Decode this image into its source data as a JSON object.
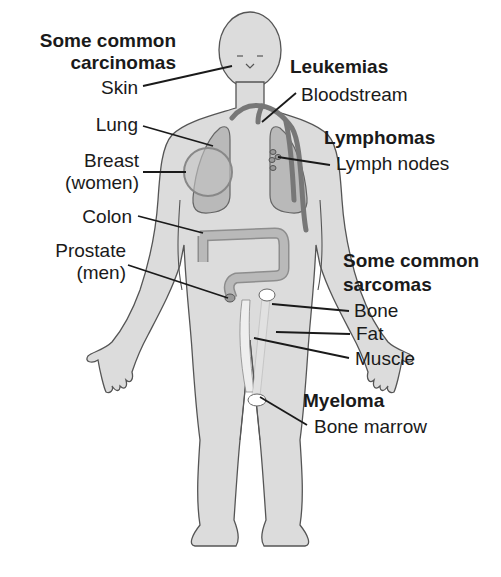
{
  "diagram": {
    "type": "anatomical-illustration",
    "colors": {
      "body_fill": "#dcdcdc",
      "body_outline": "#555555",
      "organ_fill": "#b9b9b9",
      "vessel": "#777777",
      "leader_line": "#1a1a1a",
      "bone": "#ffffff"
    }
  },
  "groups": {
    "carcinomas": {
      "title_line1": "Some common",
      "title_line2": "carcinomas",
      "items": [
        {
          "label": "Skin"
        },
        {
          "label": "Lung"
        },
        {
          "label": "Breast",
          "label2": "(women)"
        },
        {
          "label": "Colon"
        },
        {
          "label": "Prostate",
          "label2": "(men)"
        }
      ]
    },
    "leukemias": {
      "title": "Leukemias",
      "items": [
        {
          "label": "Bloodstream"
        }
      ]
    },
    "lymphomas": {
      "title": "Lymphomas",
      "items": [
        {
          "label": "Lymph nodes"
        }
      ]
    },
    "sarcomas": {
      "title_line1": "Some common",
      "title_line2": "sarcomas",
      "items": [
        {
          "label": "Bone"
        },
        {
          "label": "Fat"
        },
        {
          "label": "Muscle"
        }
      ]
    },
    "myeloma": {
      "title": "Myeloma",
      "items": [
        {
          "label": "Bone marrow"
        }
      ]
    }
  }
}
